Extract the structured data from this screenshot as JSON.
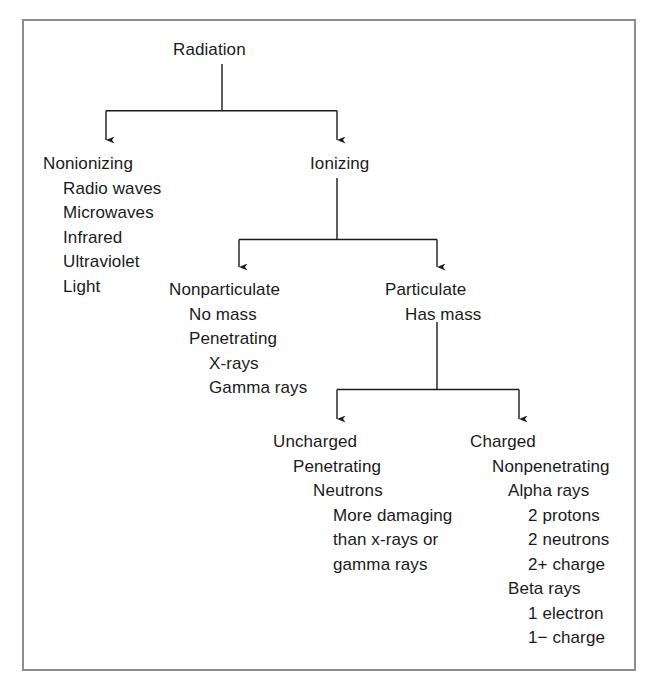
{
  "diagram": {
    "background_color": "#ffffff",
    "border_color": "#8c8c8c",
    "text_color": "#1a1a1a",
    "line_color": "#1a1a1a",
    "root": {
      "label": "Radiation"
    },
    "nodes": {
      "radiation": {
        "lines": [
          "Radiation"
        ]
      },
      "nonionizing": {
        "lines": [
          "Nonionizing",
          "Radio waves",
          "Microwaves",
          "Infrared",
          "Ultraviolet",
          "Light"
        ]
      },
      "ionizing": {
        "lines": [
          "Ionizing"
        ]
      },
      "nonparticulate": {
        "lines": [
          "Nonparticulate",
          "No mass",
          "Penetrating",
          "X-rays",
          "Gamma rays"
        ]
      },
      "particulate": {
        "lines": [
          "Particulate",
          "Has mass"
        ]
      },
      "uncharged": {
        "lines": [
          "Uncharged",
          "Penetrating",
          "Neutrons",
          "More damaging",
          "than x-rays or",
          "gamma rays"
        ]
      },
      "charged": {
        "lines": [
          "Charged",
          "Nonpenetrating",
          "Alpha rays",
          "2 protons",
          "2 neutrons",
          "2+ charge",
          "Beta rays",
          "1 electron",
          "1− charge"
        ]
      }
    }
  }
}
